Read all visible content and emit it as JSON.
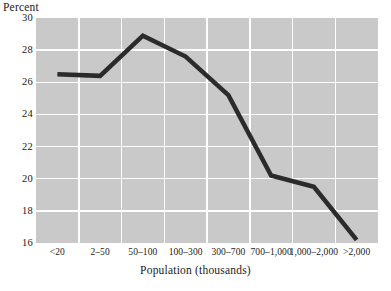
{
  "chart_data": {
    "type": "line",
    "title": "",
    "subtitle": "",
    "ylabel": "Percent",
    "xlabel": "Population (thousands)",
    "categories": [
      "<20",
      "2–50",
      "50–100",
      "100–300",
      "300–700",
      "700–1,000",
      "1,000–2,000",
      ">2,000"
    ],
    "values": [
      26.5,
      26.4,
      28.9,
      27.6,
      25.2,
      20.2,
      19.5,
      16.2
    ],
    "ylim": [
      16,
      30
    ],
    "yticks": [
      16,
      18,
      20,
      22,
      24,
      26,
      28,
      30
    ],
    "ytick_labels": [
      "16",
      "18",
      "20",
      "22",
      "24",
      "26",
      "28",
      "30"
    ],
    "grid": true,
    "legend": "none",
    "series": [
      {
        "name": "Percent",
        "values": [
          26.5,
          26.4,
          28.9,
          27.6,
          25.2,
          20.2,
          19.5,
          16.2
        ]
      }
    ],
    "colors": {
      "line": "#2b2b2b",
      "plot_background": "#c9c9c9",
      "gridline": "#ffffff",
      "text": "#1a1a1a",
      "page_background": "#ffffff"
    },
    "line_width_px": 4.5
  }
}
